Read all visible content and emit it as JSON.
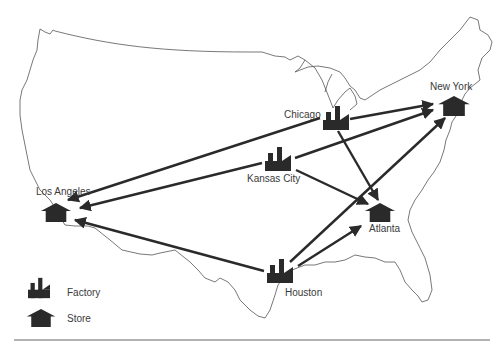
{
  "diagram": {
    "type": "distribution-network-map",
    "region": "United States",
    "legend": {
      "factory_label": "Factory",
      "store_label": "Store"
    },
    "factories": [
      {
        "name": "Chicago",
        "x": 334,
        "y": 118
      },
      {
        "name": "Kansas City",
        "x": 277,
        "y": 158
      },
      {
        "name": "Houston",
        "x": 280,
        "y": 273
      }
    ],
    "stores": [
      {
        "name": "New York",
        "x": 452,
        "y": 104
      },
      {
        "name": "Los Angeles",
        "x": 58,
        "y": 210
      },
      {
        "name": "Atlanta",
        "x": 381,
        "y": 211
      }
    ],
    "routes": [
      {
        "from": "Chicago",
        "to": "New York"
      },
      {
        "from": "Chicago",
        "to": "Los Angeles"
      },
      {
        "from": "Chicago",
        "to": "Atlanta"
      },
      {
        "from": "Kansas City",
        "to": "New York"
      },
      {
        "from": "Kansas City",
        "to": "Los Angeles"
      },
      {
        "from": "Kansas City",
        "to": "Atlanta"
      },
      {
        "from": "Houston",
        "to": "New York"
      },
      {
        "from": "Houston",
        "to": "Los Angeles"
      },
      {
        "from": "Houston",
        "to": "Atlanta"
      }
    ],
    "labels": {
      "chicago": "Chicago",
      "kansas_city": "Kansas City",
      "houston": "Houston",
      "new_york": "New York",
      "los_angeles": "Los Angeles",
      "atlanta": "Atlanta"
    },
    "colors": {
      "icon": "#2a2a2a",
      "route": "#2a2a2a",
      "border": "#555555",
      "text": "#3a3a3a"
    }
  }
}
